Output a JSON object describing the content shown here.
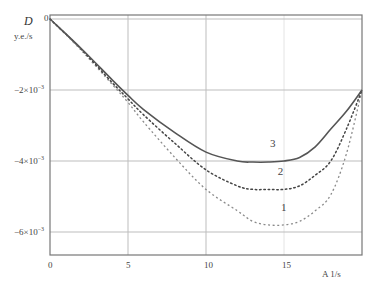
{
  "chart_data": {
    "type": "line",
    "title": "",
    "ylabel": "D",
    "yunit": "y.e./s",
    "xlabel": "A 1/s",
    "xlim": [
      0,
      20
    ],
    "ylim": [
      -0.00665,
      0.0001
    ],
    "grid": true,
    "xticks": [
      {
        "value": 0,
        "label": "0"
      },
      {
        "value": 5,
        "label": "5"
      },
      {
        "value": 10,
        "label": "10"
      },
      {
        "value": 15,
        "label": "15"
      }
    ],
    "yticks": [
      {
        "value": 0,
        "label": "0"
      },
      {
        "value": -0.002,
        "label": "−2×10",
        "exp": "−3"
      },
      {
        "value": -0.004,
        "label": "−4×10",
        "exp": "−3"
      },
      {
        "value": -0.006,
        "label": "−6×10",
        "exp": "−3"
      }
    ],
    "x": [
      0,
      2,
      4,
      5,
      6,
      8,
      10,
      12,
      13,
      14,
      15,
      16,
      17,
      18,
      19,
      20
    ],
    "series": [
      {
        "name": "1",
        "style": "dashed-dotted-light",
        "color": "#8a8a8a",
        "values": [
          0,
          -0.00088,
          -0.00185,
          -0.00235,
          -0.0029,
          -0.0039,
          -0.0048,
          -0.0054,
          -0.0057,
          -0.0058,
          -0.0058,
          -0.0057,
          -0.0054,
          -0.00495,
          -0.0038,
          -0.002
        ],
        "label_pos": {
          "x": 14.8,
          "y": -0.0054
        }
      },
      {
        "name": "2",
        "style": "dotted",
        "color": "#444444",
        "values": [
          0,
          -0.00085,
          -0.0018,
          -0.00225,
          -0.0027,
          -0.0035,
          -0.00425,
          -0.0047,
          -0.0048,
          -0.0048,
          -0.0048,
          -0.0047,
          -0.0044,
          -0.004,
          -0.0031,
          -0.002
        ],
        "label_pos": {
          "x": 14.6,
          "y": -0.0044
        }
      },
      {
        "name": "3",
        "style": "solid",
        "color": "#555555",
        "values": [
          0,
          -0.00083,
          -0.00172,
          -0.00215,
          -0.00255,
          -0.0032,
          -0.00375,
          -0.004,
          -0.00403,
          -0.00403,
          -0.004,
          -0.0039,
          -0.0036,
          -0.0031,
          -0.0026,
          -0.002
        ],
        "label_pos": {
          "x": 14.1,
          "y": -0.0036
        }
      }
    ]
  }
}
